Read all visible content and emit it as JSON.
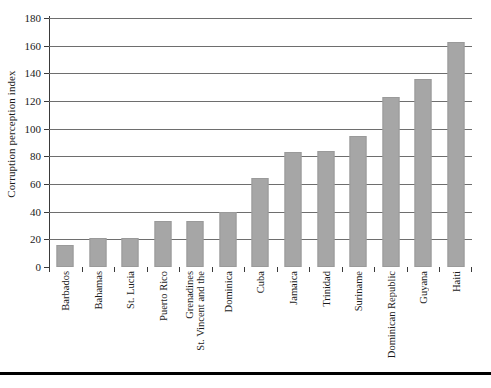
{
  "chart_data": {
    "type": "bar",
    "title": "",
    "xlabel": "",
    "ylabel": "Corruption perception index",
    "ylim": [
      0,
      180
    ],
    "yticks": [
      0,
      20,
      40,
      60,
      80,
      100,
      120,
      140,
      160,
      180
    ],
    "grid": true,
    "legend": null,
    "bar_color": "#a6a6a6",
    "categories": [
      "Barbados",
      "Bahamas",
      "St. Lucia",
      "Puerto Rico",
      "St. Vincent and the Grenadines",
      "Dominica",
      "Cuba",
      "Jamaica",
      "Trinidad",
      "Suriname",
      "Dominican Republic",
      "Guyana",
      "Haiti"
    ],
    "category_lines": [
      [
        "Barbados"
      ],
      [
        "Bahamas"
      ],
      [
        "St. Lucia"
      ],
      [
        "Puerto Rico"
      ],
      [
        "St. Vincent and the",
        "Grenadines"
      ],
      [
        "Dominica"
      ],
      [
        "Cuba"
      ],
      [
        "Jamaica"
      ],
      [
        "Trinidad"
      ],
      [
        "Suriname"
      ],
      [
        "Dominican Republic"
      ],
      [
        "Guyana"
      ],
      [
        "Haiti"
      ]
    ],
    "values": [
      16,
      21,
      21,
      33,
      33,
      40,
      64,
      83,
      84,
      95,
      123,
      136,
      163
    ]
  }
}
